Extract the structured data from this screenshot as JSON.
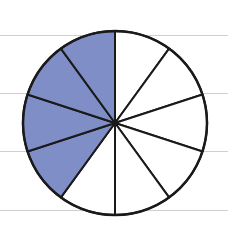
{
  "diagram": {
    "title": "",
    "type": "fraction-circle",
    "total_slices": 10,
    "shaded_slices": 4,
    "fraction_shaded": "4/10",
    "shaded_color": "#7f8ec7",
    "unshaded_color": "#ffffff",
    "stroke_color": "#1a1a1a",
    "ruled_line_color": "#cfcfcf",
    "ruled_lines_y": [
      35,
      93,
      151,
      210
    ],
    "circle": {
      "cx": 115,
      "cy": 123,
      "r": 92
    }
  }
}
